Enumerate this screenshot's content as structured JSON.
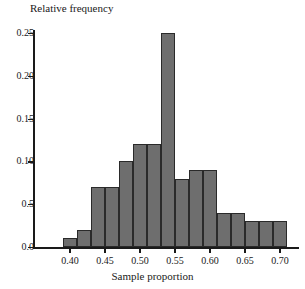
{
  "chart_data": {
    "type": "bar",
    "title": "",
    "xlabel": "Sample proportion",
    "ylabel": "Relative frequency",
    "xlim": [
      0.373,
      0.753
    ],
    "ylim": [
      0.0,
      0.262
    ],
    "grid": false,
    "legend": "none",
    "bar_color": "#6e6e6e",
    "bar_edge_color": "#2a2a2a",
    "bin_width": 0.02,
    "bin_edges": [
      0.39,
      0.41,
      0.43,
      0.45,
      0.47,
      0.49,
      0.51,
      0.53,
      0.55,
      0.57,
      0.59,
      0.61,
      0.63,
      0.65,
      0.67,
      0.69,
      0.71
    ],
    "categories": [
      "0.39-0.41",
      "0.41-0.43",
      "0.43-0.45",
      "0.45-0.47",
      "0.47-0.49",
      "0.49-0.51",
      "0.51-0.53",
      "0.53-0.55",
      "0.55-0.57",
      "0.57-0.59",
      "0.59-0.61",
      "0.61-0.63",
      "0.63-0.65",
      "0.65-0.67",
      "0.67-0.69",
      "0.69-0.71"
    ],
    "values": [
      0.01,
      0.02,
      0.07,
      0.1,
      0.12,
      0.12,
      0.12,
      0.25,
      0.08,
      0.09,
      0.09,
      0.04,
      0.04,
      0.03,
      0.03,
      0.03
    ],
    "bars": [
      {
        "x0": 0.39,
        "x1": 0.41,
        "value": 0.01
      },
      {
        "x0": 0.41,
        "x1": 0.43,
        "value": 0.02
      },
      {
        "x0": 0.43,
        "x1": 0.45,
        "value": 0.07
      },
      {
        "x0": 0.45,
        "x1": 0.47,
        "value": 0.07
      },
      {
        "x0": 0.47,
        "x1": 0.49,
        "value": 0.1
      },
      {
        "x0": 0.49,
        "x1": 0.51,
        "value": 0.12
      },
      {
        "x0": 0.51,
        "x1": 0.53,
        "value": 0.12
      },
      {
        "x0": 0.53,
        "x1": 0.55,
        "value": 0.25
      },
      {
        "x0": 0.55,
        "x1": 0.57,
        "value": 0.08
      },
      {
        "x0": 0.57,
        "x1": 0.59,
        "value": 0.09
      },
      {
        "x0": 0.59,
        "x1": 0.61,
        "value": 0.09
      },
      {
        "x0": 0.61,
        "x1": 0.63,
        "value": 0.04
      },
      {
        "x0": 0.63,
        "x1": 0.65,
        "value": 0.04
      },
      {
        "x0": 0.65,
        "x1": 0.67,
        "value": 0.03
      },
      {
        "x0": 0.67,
        "x1": 0.69,
        "value": 0.03
      },
      {
        "x0": 0.69,
        "x1": 0.71,
        "value": 0.03
      }
    ],
    "yticks": [
      {
        "value": 0.0,
        "label": "0.0"
      },
      {
        "value": 0.05,
        "label": "0.5"
      },
      {
        "value": 0.1,
        "label": "0.10"
      },
      {
        "value": 0.15,
        "label": "0.15"
      },
      {
        "value": 0.2,
        "label": "0.20"
      },
      {
        "value": 0.25,
        "label": "0.25"
      }
    ],
    "xticks": [
      {
        "value": 0.4,
        "label": "0.40"
      },
      {
        "value": 0.45,
        "label": "0.45"
      },
      {
        "value": 0.5,
        "label": "0.50"
      },
      {
        "value": 0.55,
        "label": "0.55"
      },
      {
        "value": 0.6,
        "label": "0.60"
      },
      {
        "value": 0.65,
        "label": "0.65"
      },
      {
        "value": 0.7,
        "label": "0.70"
      }
    ]
  }
}
